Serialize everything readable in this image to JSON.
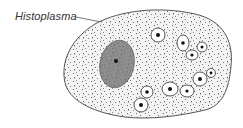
{
  "figure": {
    "label": "Histoplasma",
    "colors": {
      "cytoplasm": "#f2f2f2",
      "outline": "#555555",
      "nucleus": "#8c8c8c",
      "nucleus_edge": "#6a6a6a",
      "organism_fill": "#ffffff",
      "organism_core": "#111111",
      "stipple": "#333333"
    },
    "organisms": [
      {
        "cx": 158,
        "cy": 35,
        "rx": 7,
        "ry": 7,
        "core": 2
      },
      {
        "cx": 183,
        "cy": 43,
        "rx": 6,
        "ry": 8,
        "core": 1.8
      },
      {
        "cx": 202,
        "cy": 47,
        "rx": 5,
        "ry": 5,
        "core": 1.5
      },
      {
        "cx": 192,
        "cy": 55,
        "rx": 6,
        "ry": 5,
        "core": 1.6
      },
      {
        "cx": 200,
        "cy": 79,
        "rx": 7,
        "ry": 7,
        "core": 2
      },
      {
        "cx": 211,
        "cy": 73,
        "rx": 4.5,
        "ry": 4.5,
        "core": 1.4
      },
      {
        "cx": 170,
        "cy": 89,
        "rx": 8,
        "ry": 7,
        "core": 2
      },
      {
        "cx": 187,
        "cy": 91,
        "rx": 7,
        "ry": 6,
        "core": 1.6
      },
      {
        "cx": 147,
        "cy": 92,
        "rx": 6,
        "ry": 6,
        "core": 1.8
      },
      {
        "cx": 141,
        "cy": 105,
        "rx": 7,
        "ry": 7,
        "core": 2
      }
    ]
  }
}
